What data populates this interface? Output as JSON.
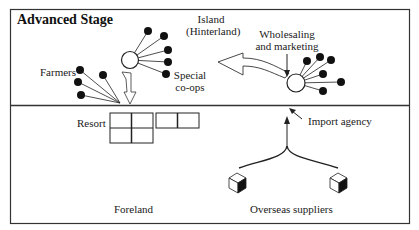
{
  "diagram": {
    "title": "Advanced Stage",
    "upper_region": {
      "island_label_line1": "Island",
      "island_label_line2": "(Hinterland)",
      "farmers_label": "Farmers",
      "special_coops_line1": "Special",
      "special_coops_line2": "co-ops",
      "wholesaling_line1": "Wholesaling",
      "wholesaling_line2": "and marketing"
    },
    "lower_region": {
      "resort_label": "Resort",
      "import_agency_label": "Import agency",
      "foreland_label": "Foreland",
      "overseas_suppliers_label": "Overseas suppliers"
    },
    "colors": {
      "line": "#222222",
      "node_fill": "#111111",
      "background": "#ffffff"
    }
  }
}
